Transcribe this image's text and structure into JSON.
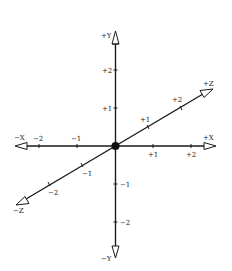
{
  "diagram": {
    "origin": {
      "x": 115.5,
      "y": 146
    },
    "colors": {
      "axis": "#1a1a1a",
      "background": "#ffffff",
      "arrow_fill": "#ffffff"
    },
    "axes": {
      "y_pos_label": "+Y",
      "y_neg_label": "−Y",
      "x_pos_label": "+X",
      "x_neg_label": "−X",
      "z_pos_label": "+Z",
      "z_neg_label": "−Z"
    },
    "ticks": {
      "y": [
        {
          "label": "+2",
          "value": 2
        },
        {
          "label": "+1",
          "value": 1
        },
        {
          "label": "−1",
          "value": -1
        },
        {
          "label": "−2",
          "value": -2
        }
      ],
      "x": [
        {
          "label": "−2",
          "value": -2
        },
        {
          "label": "−1",
          "value": -1
        },
        {
          "label": "+1",
          "value": 1
        },
        {
          "label": "+2",
          "value": 2
        }
      ],
      "z": [
        {
          "label": "+1",
          "value": 1
        },
        {
          "label": "+2",
          "value": 2
        },
        {
          "label": "−1",
          "value": -1
        },
        {
          "label": "−2",
          "value": -2
        }
      ]
    }
  }
}
